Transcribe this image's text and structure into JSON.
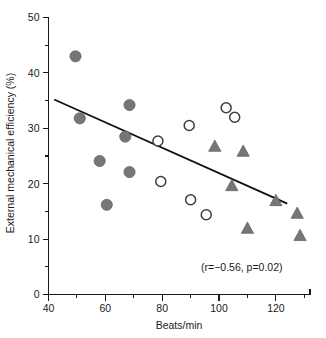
{
  "chart_data": {
    "type": "scatter",
    "title": "",
    "xlabel": "Beats/min",
    "ylabel": "External mechanical efficiency (%)",
    "xlim": [
      40,
      132
    ],
    "ylim": [
      0,
      50
    ],
    "grid": false,
    "legend_position": "none",
    "x_ticks_major": [
      40,
      60,
      80,
      100,
      120
    ],
    "x_ticks_minor": [
      50,
      70,
      90,
      110,
      130
    ],
    "y_ticks_major": [
      0,
      10,
      20,
      30,
      40,
      50
    ],
    "y_ticks_minor": [
      5,
      15,
      25,
      35,
      45
    ],
    "x_tick_labels": [
      "40",
      "60",
      "80",
      "100",
      "120"
    ],
    "y_tick_labels": [
      "0",
      "10",
      "20",
      "30",
      "40",
      "50"
    ],
    "annotation": "(r=−0.56, p=0.02)",
    "annotation_x": 108,
    "annotation_y": 4.2,
    "trendline": {
      "name": "regression-line",
      "x1": 42,
      "y1": 35.2,
      "x2": 124,
      "y2": 16.4,
      "color": "#111111"
    },
    "series": [
      {
        "name": "Group A (filled circles)",
        "marker": "filled-circle",
        "color": "#767676",
        "points": [
          {
            "x": 49.5,
            "y": 43.0
          },
          {
            "x": 51.0,
            "y": 31.8
          },
          {
            "x": 58.0,
            "y": 24.1
          },
          {
            "x": 60.5,
            "y": 16.2
          },
          {
            "x": 67.0,
            "y": 28.5
          },
          {
            "x": 68.5,
            "y": 34.2
          },
          {
            "x": 68.5,
            "y": 22.1
          }
        ]
      },
      {
        "name": "Group B (open circles)",
        "marker": "open-circle",
        "color": "#3d3d3d",
        "points": [
          {
            "x": 78.5,
            "y": 27.7
          },
          {
            "x": 79.5,
            "y": 20.4
          },
          {
            "x": 89.5,
            "y": 30.5
          },
          {
            "x": 90.0,
            "y": 17.1
          },
          {
            "x": 95.5,
            "y": 14.4
          },
          {
            "x": 102.5,
            "y": 33.7
          },
          {
            "x": 105.5,
            "y": 32.0
          }
        ]
      },
      {
        "name": "Group C (filled triangles)",
        "marker": "filled-triangle",
        "color": "#767676",
        "points": [
          {
            "x": 98.5,
            "y": 26.7
          },
          {
            "x": 108.5,
            "y": 25.8
          },
          {
            "x": 104.5,
            "y": 19.6
          },
          {
            "x": 110.0,
            "y": 11.9
          },
          {
            "x": 120.0,
            "y": 16.9
          },
          {
            "x": 127.5,
            "y": 14.6
          },
          {
            "x": 128.5,
            "y": 10.6
          }
        ]
      }
    ]
  }
}
